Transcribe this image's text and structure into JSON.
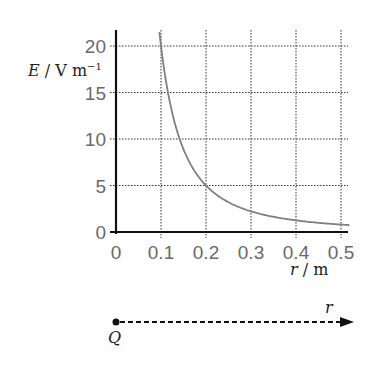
{
  "chart_data": {
    "type": "line",
    "title": "",
    "xlabel": "r / m",
    "ylabel": "E / V m^-1",
    "ylabel_parts": {
      "symbol": "E",
      "unit": " / V m",
      "sup": "−1"
    },
    "xlabel_parts": {
      "symbol": "r",
      "unit": " / m"
    },
    "xlim": [
      0,
      0.52
    ],
    "ylim": [
      0,
      21
    ],
    "x_ticks": [
      "0",
      "0.1",
      "0.2",
      "0.3",
      "0.4",
      "0.5"
    ],
    "y_ticks": [
      "0",
      "5",
      "10",
      "15",
      "20"
    ],
    "grid": true,
    "series": [
      {
        "name": "E vs r",
        "formula": "E = 0.2 / r^2",
        "x": [
          0.1,
          0.15,
          0.2,
          0.25,
          0.3,
          0.35,
          0.4,
          0.45,
          0.5,
          0.52
        ],
        "values": [
          20,
          8.9,
          5,
          3.2,
          2.2,
          1.6,
          1.25,
          0.99,
          0.8,
          0.74
        ],
        "color": "#808080"
      }
    ]
  },
  "diagram": {
    "charge_label": "Q",
    "direction_label": "r"
  },
  "colors": {
    "axis": "#111111",
    "grid": "#333333",
    "curve": "#808080",
    "tick_text": "#6a6a6a"
  }
}
